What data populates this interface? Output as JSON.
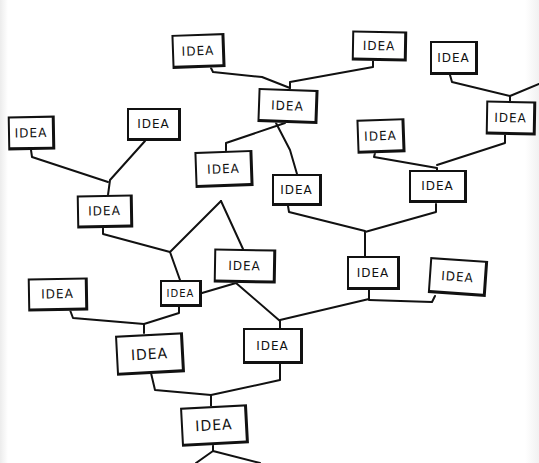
{
  "diagram": {
    "title": "",
    "type": "hand-drawn idea tree",
    "line_color": "#111111",
    "background": "#ffffff",
    "nodes": [
      {
        "id": "n1",
        "label": "IDEA",
        "x": 172,
        "y": 34,
        "w": 53,
        "h": 34,
        "rot": -2
      },
      {
        "id": "n2",
        "label": "IDEA",
        "x": 352,
        "y": 31,
        "w": 55,
        "h": 30,
        "rot": 1
      },
      {
        "id": "n3",
        "label": "IDEA",
        "x": 430,
        "y": 41,
        "w": 48,
        "h": 34,
        "rot": 0
      },
      {
        "id": "n4",
        "label": "IDEA",
        "x": 258,
        "y": 89,
        "w": 60,
        "h": 34,
        "rot": 2
      },
      {
        "id": "n5",
        "label": "IDEA",
        "x": 486,
        "y": 101,
        "w": 50,
        "h": 34,
        "rot": 1
      },
      {
        "id": "n6",
        "label": "IDEA",
        "x": 8,
        "y": 116,
        "w": 47,
        "h": 34,
        "rot": -1
      },
      {
        "id": "n7",
        "label": "IDEA",
        "x": 127,
        "y": 108,
        "w": 54,
        "h": 33,
        "rot": 0
      },
      {
        "id": "n8",
        "label": "IDEA",
        "x": 195,
        "y": 151,
        "w": 58,
        "h": 36,
        "rot": -2
      },
      {
        "id": "n9",
        "label": "IDEA",
        "x": 357,
        "y": 119,
        "w": 48,
        "h": 34,
        "rot": -2
      },
      {
        "id": "n10",
        "label": "IDEA",
        "x": 272,
        "y": 174,
        "w": 50,
        "h": 32,
        "rot": 0
      },
      {
        "id": "n11",
        "label": "IDEA",
        "x": 409,
        "y": 170,
        "w": 58,
        "h": 33,
        "rot": 0
      },
      {
        "id": "n12",
        "label": "IDEA",
        "x": 77,
        "y": 195,
        "w": 56,
        "h": 33,
        "rot": -1
      },
      {
        "id": "n13",
        "label": "IDEA",
        "x": 214,
        "y": 249,
        "w": 62,
        "h": 34,
        "rot": 1
      },
      {
        "id": "n14",
        "label": "IDEA",
        "x": 347,
        "y": 256,
        "w": 53,
        "h": 34,
        "rot": 0
      },
      {
        "id": "n15",
        "label": "IDEA",
        "x": 429,
        "y": 259,
        "w": 58,
        "h": 36,
        "rot": 4
      },
      {
        "id": "n16",
        "label": "IDEA",
        "x": 28,
        "y": 278,
        "w": 60,
        "h": 33,
        "rot": -1
      },
      {
        "id": "n17",
        "label": "IDEA",
        "x": 160,
        "y": 280,
        "w": 42,
        "h": 27,
        "rot": 0
      },
      {
        "id": "n18",
        "label": "IDEA",
        "x": 116,
        "y": 334,
        "w": 68,
        "h": 40,
        "rot": -3
      },
      {
        "id": "n19",
        "label": "IDEA",
        "x": 243,
        "y": 328,
        "w": 60,
        "h": 36,
        "rot": 0
      },
      {
        "id": "n20",
        "label": "IDEA",
        "x": 181,
        "y": 406,
        "w": 67,
        "h": 39,
        "rot": -3
      }
    ],
    "links": [
      {
        "from": "n1",
        "to": "n4",
        "path": "M211 68 L213 72 L262 77 L290 88"
      },
      {
        "from": "n2",
        "to": "n4",
        "path": "M373 61 L373 67 L290 82 L290 88"
      },
      {
        "from": "n3",
        "to": "n5",
        "path": "M450 75 L452 82 L510 96 L510 101"
      },
      {
        "from": "n5",
        "to": "n5-right",
        "path": "M510 96 L539 84"
      },
      {
        "from": "n4",
        "to": "n8",
        "path": "M285 123 L226 143 L226 152"
      },
      {
        "from": "n4",
        "to": "n10",
        "path": "M276 123 L290 150 L297 174"
      },
      {
        "from": "n9",
        "to": "n11",
        "path": "M375 153 L374 157 L437 168 L437 170"
      },
      {
        "from": "n5",
        "to": "n11",
        "path": "M505 135 L505 143 L437 165"
      },
      {
        "from": "n6",
        "to": "n12",
        "path": "M31 150 L32 157 L108 182"
      },
      {
        "from": "n7",
        "to": "n12",
        "path": "M145 141 L110 180 L108 195"
      },
      {
        "from": "n10",
        "to": "n14",
        "path": "M288 206 L289 212 L365 231"
      },
      {
        "from": "n11",
        "to": "n14",
        "path": "M436 204 L436 212 L365 232 L365 256"
      },
      {
        "from": "n8",
        "to": "n17",
        "path": "M221 201 L170 252 L180 280"
      },
      {
        "from": "n12",
        "to": "n17",
        "path": "M103 228 L103 234 L170 252"
      },
      {
        "from": "n8",
        "to": "n13",
        "path": "M221 201 L243 249"
      },
      {
        "from": "n14",
        "to": "n19",
        "path": "M369 290 L369 299 L280 320 L280 328"
      },
      {
        "from": "n15",
        "to": "n19",
        "path": "M435 296 L432 302 L369 300"
      },
      {
        "from": "n13",
        "to": "n19",
        "path": "M236 283 L280 321"
      },
      {
        "from": "n13",
        "to": "n17",
        "path": "M236 283 L202 293"
      },
      {
        "from": "n16",
        "to": "n18",
        "path": "M70 310 L73 318 L144 324 L144 333"
      },
      {
        "from": "n17",
        "to": "n18",
        "path": "M179 307 L179 313 L144 324"
      },
      {
        "from": "n18",
        "to": "n20",
        "path": "M151 373 L155 390 L211 395 L211 406"
      },
      {
        "from": "n19",
        "to": "n20",
        "path": "M280 364 L280 380 L211 395"
      },
      {
        "from": "n20",
        "to": "below",
        "path": "M213 445 L213 451 L196 463 M213 451 L260 463"
      }
    ]
  }
}
